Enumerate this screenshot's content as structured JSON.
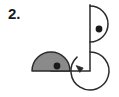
{
  "figure": {
    "problem_number": "2.",
    "colors": {
      "stroke": "#2b2b2b",
      "gray_fill": "#8a8a8a",
      "dot": "#1a1a1a",
      "background": "#ffffff"
    },
    "shapes": {
      "left_semicircle": {
        "name": "gray-filled-semicircle",
        "fill": "#8a8a8a",
        "flat_side": "bottom",
        "center_x": 51,
        "center_y": 71,
        "radius": 19,
        "dot_x": 57,
        "dot_y": 66,
        "dot_radius": 3.4
      },
      "top_right_semicircle": {
        "name": "outlined-semicircle",
        "fill": "none",
        "flat_side": "left",
        "center_x": 90,
        "center_y": 24,
        "radius": 18,
        "dot_x": 99,
        "dot_y": 29,
        "dot_radius": 3.4
      },
      "bottom_right_arc": {
        "name": "three-quarter-arc-with-arrow",
        "center_x": 90,
        "center_y": 71,
        "radius": 19,
        "start_angle_deg": -90,
        "sweep_deg": 280,
        "arrow_at": "end",
        "arrow_x": 79,
        "arrow_y": 70
      },
      "corner_lines": {
        "name": "right-angle-corner",
        "vertical_x": 90,
        "vertical_y_top": 5,
        "vertical_y_bottom": 71,
        "horizontal_y": 71,
        "horizontal_x_left": 51,
        "horizontal_x_right": 90
      }
    }
  }
}
